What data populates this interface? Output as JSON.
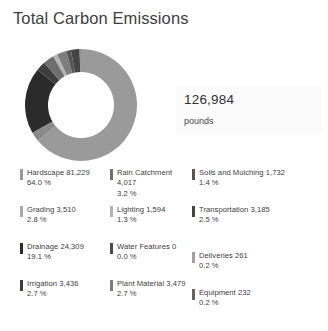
{
  "header": {
    "title": "Total Carbon Emissions"
  },
  "total": {
    "value": "126,984",
    "units": "pounds"
  },
  "chart_data": {
    "type": "pie",
    "title": "Total Carbon Emissions",
    "subtitle": "126,984 pounds",
    "variant": "donut",
    "units": "pounds",
    "total": 126984,
    "legend_position": "bottom",
    "grid": false,
    "categories": [
      "Hardscape",
      "Grading",
      "Drainage",
      "Irrigation",
      "Rain Catchment",
      "Lighting",
      "Water Features",
      "Plant Material",
      "Soils and Mulching",
      "Transportation",
      "Deliveries",
      "Equipment"
    ],
    "values": [
      81229,
      3510,
      24309,
      3436,
      4017,
      1594,
      0,
      3479,
      1732,
      3185,
      261,
      232
    ],
    "percents": [
      64.0,
      2.8,
      19.1,
      2.7,
      3.2,
      1.3,
      0.0,
      2.7,
      1.4,
      2.5,
      0.2,
      0.2
    ],
    "colors": [
      "#9a9a9a",
      "#8a8a8a",
      "#2b2b2b",
      "#3d3d3d",
      "#6e6e6e",
      "#b4b4b4",
      "#4a4a4a",
      "#7d7d7d",
      "#565656",
      "#444444",
      "#9f9f9f",
      "#636363"
    ]
  },
  "legend": {
    "rows": [
      [
        {
          "label": "Hardscape 81,229",
          "percent": "64.0 %",
          "color": "#9a9a9a"
        },
        {
          "label": "Rain Catchment 4,017",
          "percent": "3.2 %",
          "color": "#6e6e6e"
        },
        {
          "label": "Soils and Mulching 1,732",
          "percent": "1.4 %",
          "color": "#565656"
        }
      ],
      [
        {
          "label": "Grading 3,510",
          "percent": "2.8 %",
          "color": "#a8a8a8"
        },
        {
          "label": "Lighting 1,594",
          "percent": "1.3 %",
          "color": "#b4b4b4"
        },
        {
          "label": "Transportation 3,185",
          "percent": "2.5 %",
          "color": "#444444"
        }
      ],
      [
        {
          "label": "Drainage 24,309",
          "percent": "19.1 %",
          "color": "#2b2b2b"
        },
        {
          "label": "Water Features 0",
          "percent": "0.0 %",
          "color": "#4a4a4a"
        },
        {
          "label": "Deliveries 261",
          "percent": "0.2 %",
          "color": "#9f9f9f"
        }
      ],
      [
        {
          "label": "Irrigation 3,436",
          "percent": "2.7 %",
          "color": "#3d3d3d"
        },
        {
          "label": "Plant Material 3,479",
          "percent": "2.7 %",
          "color": "#7d7d7d"
        },
        {
          "label": "Equipment 232",
          "percent": "0.2 %",
          "color": "#636363"
        }
      ]
    ]
  }
}
